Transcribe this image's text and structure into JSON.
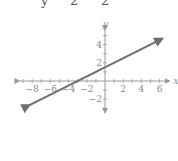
{
  "equation_fragment": {
    "parts": [
      "y",
      "2",
      "2"
    ]
  },
  "chart_data": {
    "type": "line",
    "title": "",
    "xlabel": "x",
    "ylabel": "y",
    "xlim": [
      -9,
      7
    ],
    "ylim": [
      -3.5,
      5.5
    ],
    "grid": false,
    "x_ticks": [
      -8,
      -6,
      -4,
      -2,
      2,
      4,
      6
    ],
    "x_tick_labels": [
      "−8",
      "−6",
      "−4",
      "−2",
      "2",
      "4",
      "6"
    ],
    "y_ticks": [
      4,
      2,
      -2
    ],
    "y_tick_labels": [
      "4",
      "2",
      "−2"
    ],
    "series": [
      {
        "name": "y = (1/2)x + 3/2",
        "slope": 0.5,
        "intercept": 1.5,
        "x": [
          -8.3,
          6.3
        ],
        "y": [
          -2.65,
          4.65
        ],
        "arrows": "both",
        "color": "#6e6e6e"
      }
    ],
    "axis_color": "#9a9a9a"
  }
}
